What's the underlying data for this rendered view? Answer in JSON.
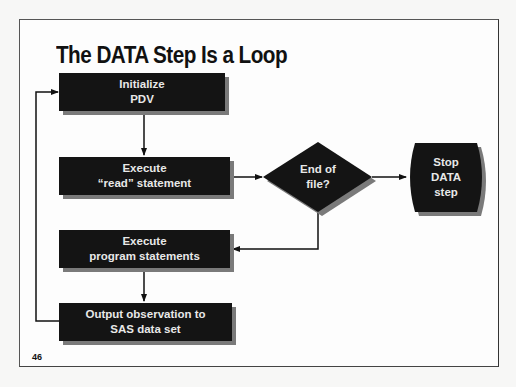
{
  "slide": {
    "title": "The DATA Step Is a Loop",
    "page_number": "46"
  },
  "flowchart": {
    "nodes": [
      {
        "id": "init",
        "shape": "process",
        "lines": [
          "Initialize",
          "PDV"
        ]
      },
      {
        "id": "read",
        "shape": "process",
        "lines": [
          "Execute",
          "“read” statement"
        ]
      },
      {
        "id": "eof",
        "shape": "decision",
        "lines": [
          "End of",
          "file?"
        ]
      },
      {
        "id": "stop",
        "shape": "terminator",
        "lines": [
          "Stop",
          "DATA",
          "step"
        ]
      },
      {
        "id": "exec",
        "shape": "process",
        "lines": [
          "Execute",
          "program statements"
        ]
      },
      {
        "id": "output",
        "shape": "process",
        "lines": [
          "Output observation to",
          "SAS data set"
        ]
      }
    ],
    "edges": [
      {
        "from": "init",
        "to": "read"
      },
      {
        "from": "read",
        "to": "eof"
      },
      {
        "from": "eof",
        "to": "stop"
      },
      {
        "from": "eof",
        "to": "exec"
      },
      {
        "from": "exec",
        "to": "output"
      },
      {
        "from": "output",
        "to": "init"
      }
    ]
  },
  "colors": {
    "shape_fill": "#141414",
    "shape_text": "#e8e8e8",
    "shadow": "#7a7a7a",
    "line": "#111111"
  }
}
